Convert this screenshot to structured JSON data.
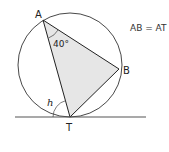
{
  "diagram": {
    "type": "circle-geometry",
    "points": {
      "A": "A",
      "B": "B",
      "T": "T"
    },
    "angle_at_A": "40°",
    "unknown_angle": "h",
    "given": "AB = AT",
    "colors": {
      "stroke": "#222222",
      "triangle_fill": "#e6e6e6",
      "tangent": "#555555"
    }
  }
}
